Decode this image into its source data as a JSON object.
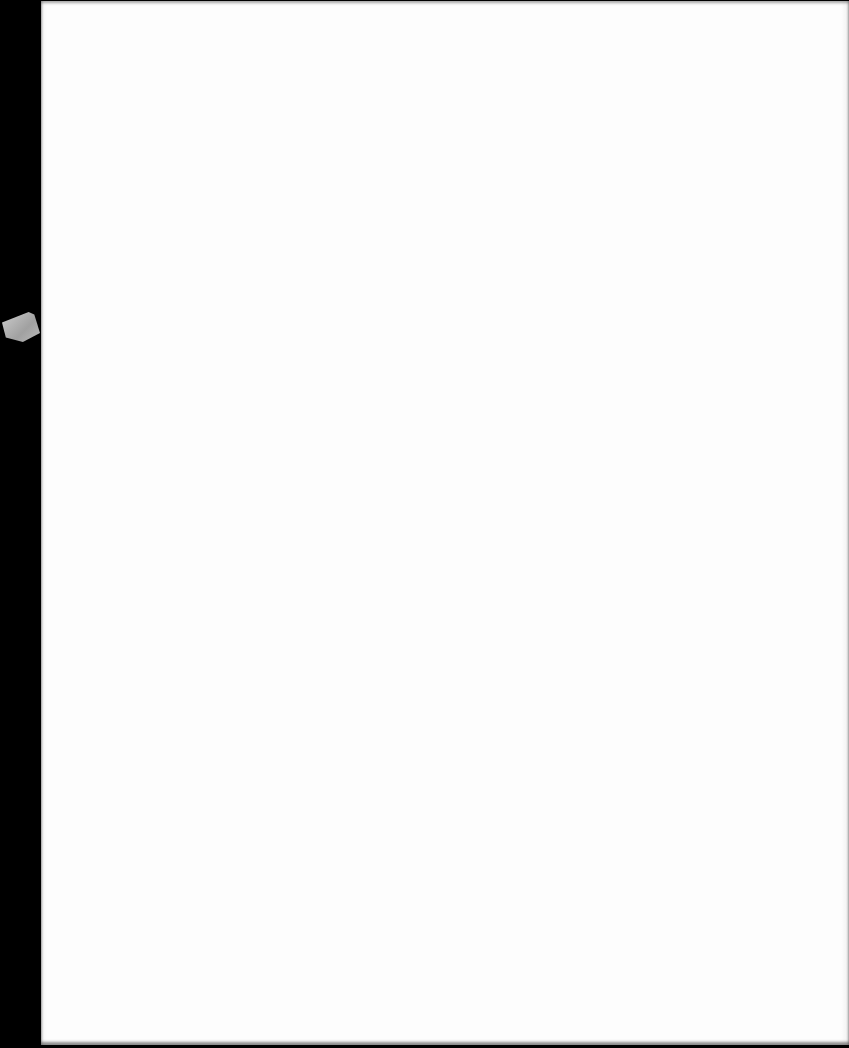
{
  "document": {
    "type": "scanned-page",
    "content": "blank",
    "bleed_through_lines": [
      "",
      "",
      "",
      ""
    ]
  },
  "colors": {
    "paper": "#fdfdfd",
    "scanner_background": "#000000",
    "tape": "#b8b8b8"
  }
}
